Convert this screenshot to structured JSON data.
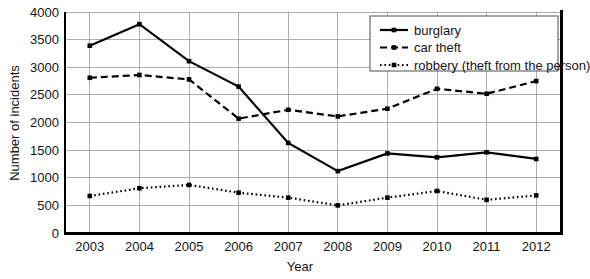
{
  "chart_data": {
    "type": "line",
    "title": "",
    "xlabel": "Year",
    "ylabel": "Number of incidents",
    "categories": [
      "2003",
      "2004",
      "2005",
      "2006",
      "2007",
      "2008",
      "2009",
      "2010",
      "2011",
      "2012"
    ],
    "x": [
      2003,
      2004,
      2005,
      2006,
      2007,
      2008,
      2009,
      2010,
      2011,
      2012
    ],
    "ylim": [
      0,
      4000
    ],
    "yticks": [
      0,
      500,
      1000,
      1500,
      2000,
      2500,
      3000,
      3500,
      4000
    ],
    "ytick_labels": [
      "0",
      "500",
      "1000",
      "1500",
      "2000",
      "2500",
      "3000",
      "3500",
      "4000"
    ],
    "grid": true,
    "legend_position": "top-right",
    "series": [
      {
        "name": "burglary",
        "style": "solid",
        "color": "#000000",
        "values": [
          3390,
          3780,
          3110,
          2650,
          1630,
          1120,
          1440,
          1370,
          1460,
          1340
        ]
      },
      {
        "name": "car theft",
        "style": "dashed",
        "color": "#000000",
        "values": [
          2810,
          2860,
          2780,
          2070,
          2230,
          2110,
          2250,
          2610,
          2520,
          2750
        ]
      },
      {
        "name": "robbery (theft from the person)",
        "style": "dotted",
        "color": "#000000",
        "values": [
          670,
          810,
          870,
          730,
          640,
          500,
          640,
          760,
          600,
          680
        ]
      }
    ]
  },
  "legend": {
    "items": [
      {
        "label": "burglary"
      },
      {
        "label": "car theft"
      },
      {
        "label": "robbery (theft from the person)"
      }
    ]
  }
}
